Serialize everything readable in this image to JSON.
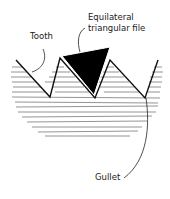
{
  "diagram": {
    "labels": {
      "tooth": "Tooth",
      "file_line1": "Equilateral",
      "file_line2": "triangular file",
      "gullet": "Gullet"
    },
    "colors": {
      "ink": "#1a1a1a",
      "hatch": "#555555",
      "file_fill": "#000000",
      "background": "#ffffff"
    }
  }
}
